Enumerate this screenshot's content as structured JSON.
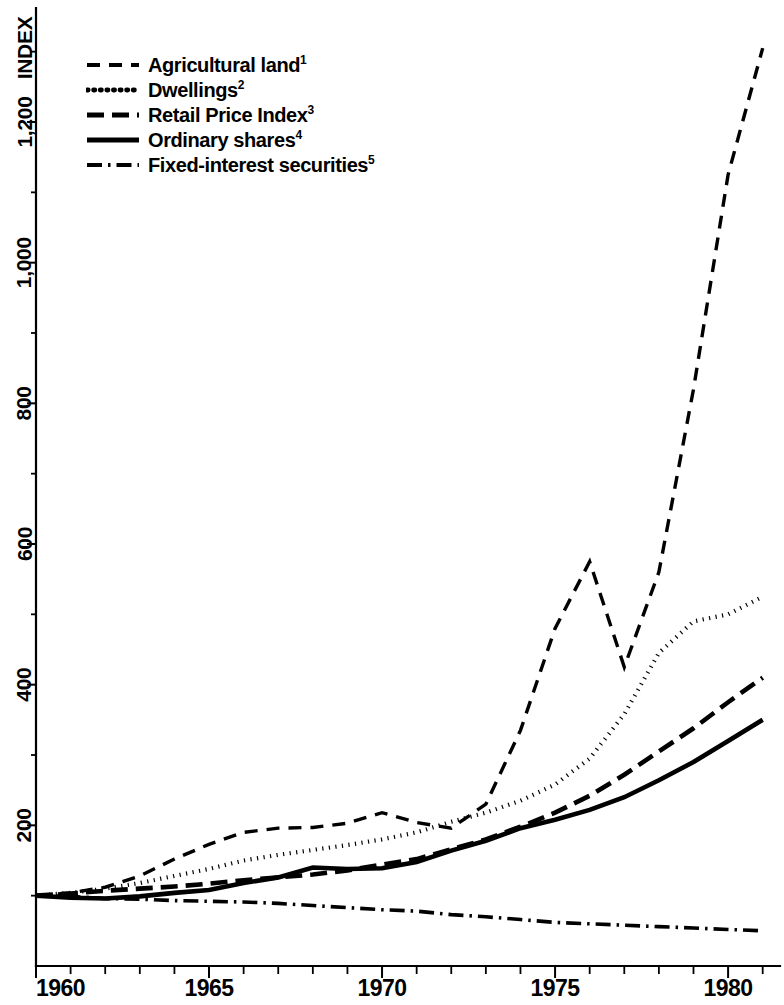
{
  "figure": {
    "axis_title": "INDEX",
    "ink_color": "#000000",
    "background_color": "#ffffff"
  },
  "legend": {
    "entries": [
      {
        "label": "Agricultural land",
        "footnote": "1",
        "style": "dashed",
        "name": "agricultural-land"
      },
      {
        "label": "Dwellings",
        "footnote": "2",
        "style": "dotted",
        "name": "dwellings"
      },
      {
        "label": "Retail Price Index",
        "footnote": "3",
        "style": "long-dash",
        "name": "retail-price-index"
      },
      {
        "label": "Ordinary shares",
        "footnote": "4",
        "style": "solid",
        "name": "ordinary-shares"
      },
      {
        "label": "Fixed-interest securities",
        "footnote": "5",
        "style": "dash-dot",
        "name": "fixed-interest-securities"
      }
    ]
  },
  "chart_data": {
    "type": "line",
    "title": "",
    "subtitle": "",
    "xlabel": "",
    "ylabel": "INDEX",
    "xlim": [
      1960,
      1981.5
    ],
    "ylim": [
      0,
      1320
    ],
    "grid": false,
    "legend_position": "top-left",
    "x_ticks_major": [
      1960,
      1965,
      1970,
      1975,
      1980
    ],
    "x_tick_labels": [
      "1960",
      "1965",
      "1970",
      "1975",
      "1980"
    ],
    "x_ticks_minor": [
      1961,
      1962,
      1963,
      1964,
      1966,
      1967,
      1968,
      1969,
      1971,
      1972,
      1973,
      1974,
      1976,
      1977,
      1978,
      1979,
      1981
    ],
    "y_ticks_major": [
      200,
      400,
      600,
      800,
      1000,
      1200
    ],
    "y_tick_labels": [
      "200",
      "400",
      "600",
      "800",
      "1,000",
      "1,200"
    ],
    "y_ticks_minor": [
      100,
      300,
      500,
      700,
      900,
      1100,
      1300
    ],
    "x": [
      1960,
      1961,
      1962,
      1963,
      1964,
      1965,
      1966,
      1967,
      1968,
      1969,
      1970,
      1971,
      1972,
      1973,
      1974,
      1975,
      1976,
      1977,
      1978,
      1979,
      1980,
      1981
    ],
    "series": [
      {
        "name": "Agricultural land",
        "footnote": "1",
        "style": "dashed",
        "values": [
          100,
          104,
          112,
          128,
          152,
          173,
          190,
          196,
          197,
          203,
          218,
          204,
          196,
          230,
          335,
          480,
          575,
          425,
          560,
          820,
          1125,
          1305
        ]
      },
      {
        "name": "Dwellings",
        "footnote": "2",
        "style": "dotted",
        "values": [
          100,
          104,
          110,
          118,
          128,
          138,
          150,
          158,
          165,
          172,
          180,
          190,
          205,
          218,
          235,
          258,
          295,
          358,
          445,
          490,
          500,
          525
        ]
      },
      {
        "name": "Retail Price Index",
        "footnote": "3",
        "style": "long-dash",
        "values": [
          100,
          103,
          107,
          110,
          113,
          117,
          122,
          126,
          130,
          136,
          144,
          152,
          166,
          180,
          198,
          218,
          242,
          272,
          305,
          338,
          375,
          410
        ]
      },
      {
        "name": "Ordinary shares",
        "footnote": "4",
        "style": "solid",
        "values": [
          100,
          97,
          96,
          99,
          104,
          108,
          118,
          126,
          140,
          138,
          139,
          148,
          164,
          178,
          196,
          208,
          222,
          240,
          264,
          290,
          320,
          350
        ]
      },
      {
        "name": "Fixed-interest securities",
        "footnote": "5",
        "style": "dash-dot",
        "values": [
          100,
          99,
          96,
          95,
          93,
          92,
          91,
          89,
          86,
          83,
          80,
          78,
          73,
          70,
          66,
          62,
          60,
          58,
          56,
          54,
          52,
          50
        ]
      }
    ]
  }
}
